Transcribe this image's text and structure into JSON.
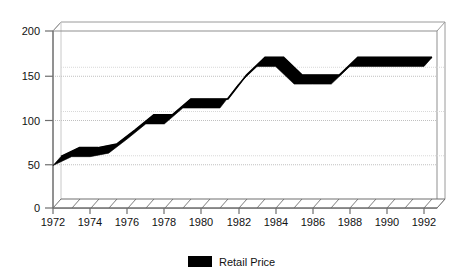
{
  "chart_data": {
    "type": "line",
    "title": "",
    "subtitle": "",
    "xlabel": "",
    "ylabel": "",
    "xlim": [
      1972,
      1992
    ],
    "ylim": [
      0,
      200
    ],
    "grid": true,
    "legend_position": "bottom-center",
    "x_ticks": [
      "1972",
      "1974",
      "1976",
      "1978",
      "1980",
      "1982",
      "1984",
      "1986",
      "1988",
      "1990",
      "1992"
    ],
    "y_ticks": [
      "0",
      "50",
      "100",
      "150",
      "200"
    ],
    "x": [
      1972,
      1973,
      1974,
      1975,
      1976,
      1977,
      1978,
      1979,
      1980,
      1981,
      1982,
      1983,
      1984,
      1985,
      1986,
      1987,
      1988,
      1989,
      1990,
      1991,
      1992
    ],
    "series": [
      {
        "name": "Retail Price",
        "color": "#000000",
        "values": [
          48,
          58,
          58,
          62,
          78,
          95,
          95,
          113,
          113,
          113,
          140,
          160,
          160,
          140,
          140,
          140,
          160,
          160,
          160,
          160,
          160
        ]
      }
    ],
    "legend": [
      {
        "label": "Retail Price",
        "color": "#000000",
        "swatch": "filled-rect"
      }
    ],
    "style": {
      "three_d": true,
      "axis_color": "#888888",
      "grid_color": "#bbbbbb",
      "base_hatch": true,
      "background": "#ffffff"
    }
  }
}
